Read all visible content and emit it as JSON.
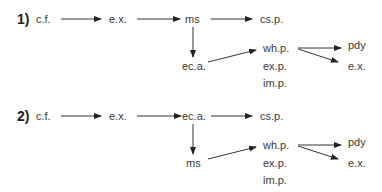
{
  "diagrams": [
    {
      "number": "1)",
      "nodes": {
        "cf": "c.f.",
        "ex1": "e.x.",
        "top3": "ms",
        "csp": "cs.p.",
        "down": "ec.a.",
        "whp": "wh.p.",
        "exp": "ex.p.",
        "imp": "im.p.",
        "pdy": "pdy",
        "ex2": "e.x."
      }
    },
    {
      "number": "2)",
      "nodes": {
        "cf": "c.f.",
        "ex1": "e.x.",
        "top3": "ec.a.",
        "csp": "cs.p.",
        "down": "ms",
        "whp": "wh.p.",
        "exp": "ex.p.",
        "imp": "im.p.",
        "pdy": "pdy",
        "ex2": "e.x."
      }
    }
  ],
  "colors": {
    "arrow": "#222222",
    "text": "#3a3a3a"
  }
}
